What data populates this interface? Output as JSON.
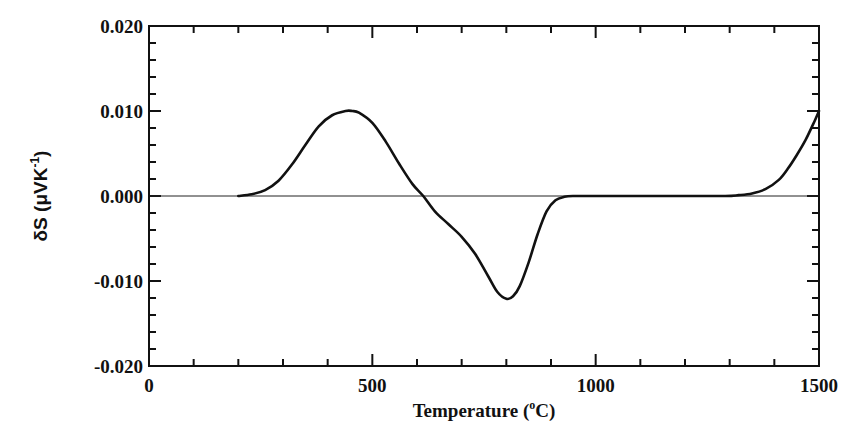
{
  "chart_data": {
    "type": "line",
    "title": "",
    "xlabel": "Temperature (°C)",
    "xlabel_parts": {
      "main": "Temperature (",
      "sup": "o",
      "tail": "C)"
    },
    "ylabel": "δS (μVK⁻¹)",
    "ylabel_parts": {
      "main": "δS  (μVK",
      "sup": "-1",
      "tail": ")"
    },
    "xlim": [
      0,
      1500
    ],
    "ylim": [
      -0.02,
      0.02
    ],
    "x_ticks": [
      0,
      500,
      1000,
      1500
    ],
    "x_tick_labels": [
      "0",
      "500",
      "1000",
      "1500"
    ],
    "x_minor_step": 100,
    "y_ticks": [
      -0.02,
      -0.01,
      0.0,
      0.01,
      0.02
    ],
    "y_tick_labels": [
      "-0.020",
      "-0.010",
      "0.000",
      "0.010",
      "0.020"
    ],
    "y_minor_step": 0.002,
    "grid": false,
    "legend": null,
    "zero_line": true,
    "series": [
      {
        "name": "δS",
        "color": "#111111",
        "x": [
          200,
          230,
          260,
          290,
          320,
          350,
          380,
          410,
          440,
          455,
          470,
          500,
          530,
          560,
          590,
          614,
          640,
          670,
          700,
          730,
          760,
          780,
          800,
          815,
          830,
          850,
          870,
          890,
          910,
          930,
          950,
          1000,
          1100,
          1200,
          1290,
          1320,
          1350,
          1380,
          1410,
          1430,
          1450,
          1470,
          1490,
          1500
        ],
        "y": [
          0.0,
          0.0002,
          0.0007,
          0.0018,
          0.0037,
          0.006,
          0.0082,
          0.0095,
          0.01,
          0.01,
          0.0098,
          0.0086,
          0.0064,
          0.0038,
          0.0014,
          0.0,
          -0.0018,
          -0.0033,
          -0.0048,
          -0.0068,
          -0.0095,
          -0.0113,
          -0.0121,
          -0.0118,
          -0.0106,
          -0.0078,
          -0.0045,
          -0.0018,
          -0.0005,
          -0.0001,
          0.0,
          0.0,
          0.0,
          0.0,
          0.0,
          0.0001,
          0.0003,
          0.0008,
          0.0019,
          0.0032,
          0.0048,
          0.0066,
          0.0088,
          0.01
        ]
      }
    ]
  }
}
